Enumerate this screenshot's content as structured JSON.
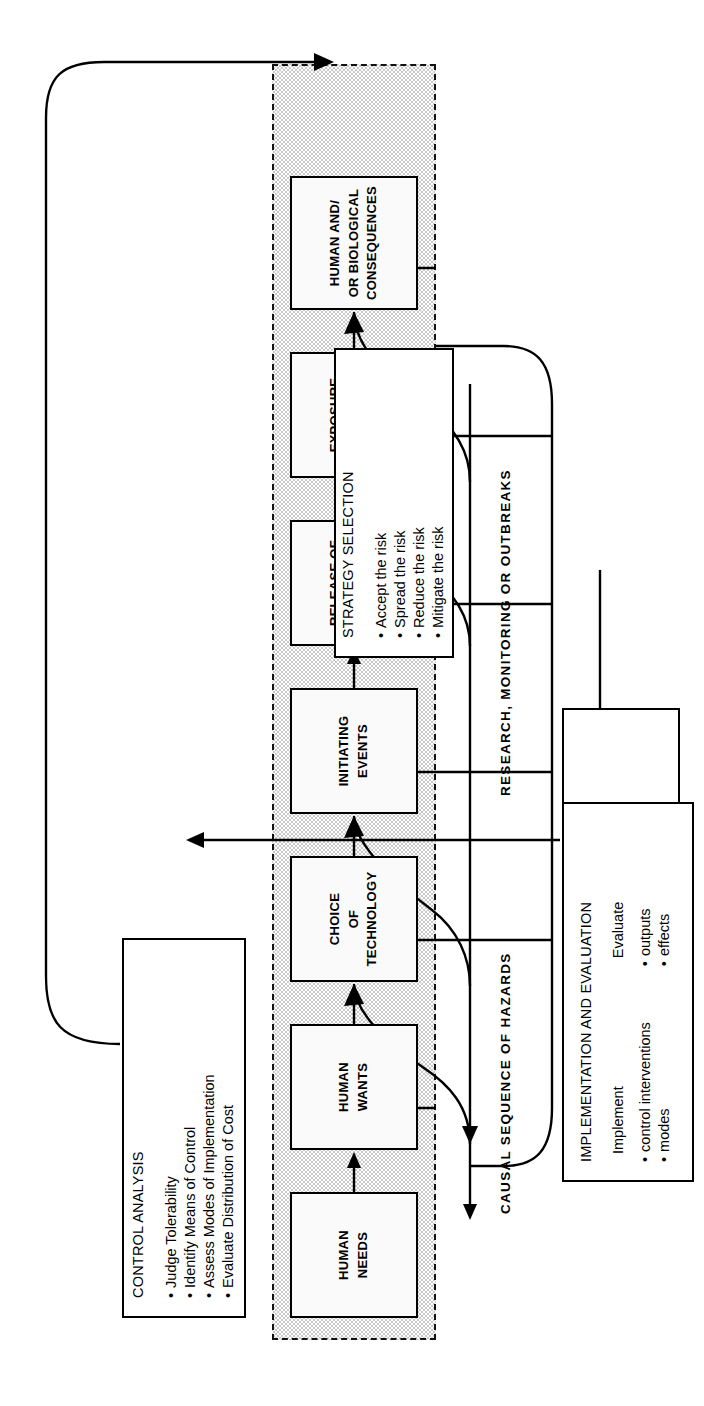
{
  "figure": {
    "type": "flowchart",
    "orientation": "rotated-90-ccw",
    "colors": {
      "ink": "#000000",
      "band_fill": "#c9c9c9",
      "box_fill": "#ffffff",
      "page": "#ffffff"
    }
  },
  "band_labels": {
    "causal": "CAUSAL   SEQUENCE   OF   HAZARDS",
    "research": "RESEARCH,   MONITORING   OR   OUTBREAKS"
  },
  "chain": [
    {
      "id": "human-needs",
      "lines": [
        "HUMAN",
        "NEEDS"
      ]
    },
    {
      "id": "human-wants",
      "lines": [
        "HUMAN",
        "WANTS"
      ]
    },
    {
      "id": "choice-of-technology",
      "lines": [
        "CHOICE",
        "OF",
        "TECHNOLOGY"
      ]
    },
    {
      "id": "initiating-events",
      "lines": [
        "INITIATING",
        "EVENTS"
      ]
    },
    {
      "id": "release",
      "lines": [
        "RELEASE OF",
        "MATERIALS",
        "OR ENERGY"
      ]
    },
    {
      "id": "exposure",
      "lines": [
        "EXPOSURE",
        "TO MATERIALS",
        "OR ENERGY"
      ]
    },
    {
      "id": "consequences",
      "lines": [
        "HUMAN AND/",
        "OR BIOLOGICAL",
        "CONSEQUENCES"
      ]
    }
  ],
  "panels": {
    "hazard_assessment": {
      "title": "HAZARD ASSESSMENT",
      "items": [
        "Identify Hazards",
        "Assign Priorities",
        "Estimate Risks",
        "Evaluate Social Values"
      ]
    },
    "control_analysis": {
      "title": "CONTROL ANALYSIS",
      "items": [
        "Judge Tolerability",
        "Identify Means of Control",
        "Assess Modes of Implementation",
        "Evaluate Distribution of Cost"
      ]
    },
    "strategy_selection": {
      "title": "STRATEGY SELECTION",
      "items": [
        "Accept the risk",
        "Spread the risk",
        "Reduce the risk",
        "Mitigate the risk"
      ]
    },
    "implementation": {
      "title": "IMPLEMENTATION AND EVALUATION",
      "col1_heading": "Implement",
      "col1_items": [
        "control interventions",
        "modes"
      ],
      "col2_heading": "Evaluate",
      "col2_items": [
        "outputs",
        "effects"
      ]
    }
  }
}
